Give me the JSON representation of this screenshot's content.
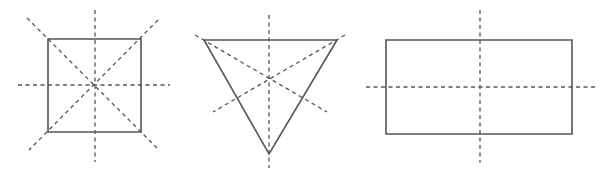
{
  "diagram": {
    "colors": {
      "shape_stroke": "#555555",
      "axis_stroke": "#555555",
      "background": "#ffffff"
    },
    "figures": [
      {
        "name": "square",
        "shape": "square",
        "symmetry_lines": 4,
        "points": "48,39 141,39 141,132 48,132",
        "axes": [
          {
            "x1": 95,
            "y1": 10,
            "x2": 95,
            "y2": 162,
            "orientation": "vertical"
          },
          {
            "x1": 18,
            "y1": 85,
            "x2": 170,
            "y2": 85,
            "orientation": "horizontal"
          },
          {
            "x1": 27,
            "y1": 18,
            "x2": 157,
            "y2": 148,
            "orientation": "diagonal"
          },
          {
            "x1": 158,
            "y1": 20,
            "x2": 29,
            "y2": 150,
            "orientation": "diagonal"
          }
        ]
      },
      {
        "name": "equilateral-triangle",
        "shape": "triangle",
        "symmetry_lines": 3,
        "points": "204,40 337,40 269,154",
        "axes": [
          {
            "x1": 269,
            "y1": 15,
            "x2": 269,
            "y2": 168,
            "orientation": "vertical"
          },
          {
            "x1": 195,
            "y1": 35,
            "x2": 327,
            "y2": 112,
            "orientation": "diagonal"
          },
          {
            "x1": 345,
            "y1": 35,
            "x2": 213,
            "y2": 112,
            "orientation": "diagonal"
          }
        ]
      },
      {
        "name": "rectangle",
        "shape": "rectangle",
        "symmetry_lines": 2,
        "points": "386,40 572,40 572,134 386,134",
        "axes": [
          {
            "x1": 480,
            "y1": 10,
            "x2": 480,
            "y2": 163,
            "orientation": "vertical"
          },
          {
            "x1": 366,
            "y1": 87,
            "x2": 597,
            "y2": 87,
            "orientation": "horizontal"
          }
        ]
      }
    ]
  }
}
